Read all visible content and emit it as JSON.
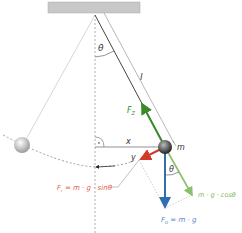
{
  "diagram": {
    "labels": {
      "theta_top": "θ",
      "length": "l",
      "tension": "F",
      "tension_sub": "Z",
      "x_axis": "x",
      "y_axis": "y",
      "mass": "m",
      "theta_bottom": "θ",
      "restoring_force": "F",
      "restoring_sub": "r",
      "restoring_expr": " = m · g · sinθ",
      "normal_component": "m · g · cosθ",
      "gravity_force": "F",
      "gravity_sub": "G",
      "gravity_expr": " = m · g"
    },
    "colors": {
      "ceiling": "#c8c8c8",
      "string": "#555555",
      "tension": "#3a8a2a",
      "normal": "#8cbf6a",
      "restoring": "#d23a28",
      "gravity": "#2f6fb0",
      "restoring_text": "#e0603c",
      "gravity_text": "#4d86c6",
      "normal_text": "#7fb55a",
      "guide": "#999999"
    }
  }
}
